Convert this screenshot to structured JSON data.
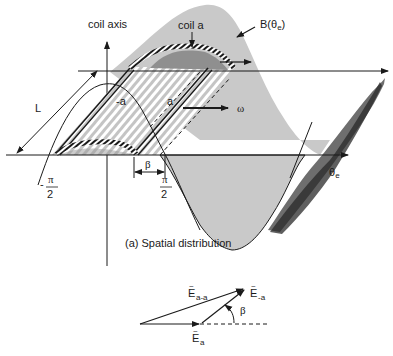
{
  "figure": {
    "top": {
      "coil_axis_label": "coil axis",
      "coil_a_label": "coil a",
      "flux_density_label": "B(θ",
      "flux_density_sub": "e",
      "flux_density_close": ")",
      "length_label": "L",
      "side_neg_a_label": "-a",
      "side_a_label": "a",
      "omega_label": "ω",
      "beta_label": "β",
      "neg_pi_minus": "-",
      "pi_label": "π",
      "two_label": "2",
      "theta_label": "θ",
      "theta_sub": "e",
      "caption": "(a) Spatial  distribution"
    },
    "phasor": {
      "e_a_minus_a_label": "E",
      "e_a_minus_a_sub": "a-a",
      "e_minus_a_label": "E",
      "e_minus_a_sub": "-a",
      "e_a_label": "E",
      "e_a_sub": "a",
      "tilde": "~",
      "beta_label": "β"
    },
    "colors": {
      "wave_fill": "#c8c8c8",
      "wave_dark": "#8a8a8a",
      "wave_shadow": "#555555",
      "hatch": "#bdbdbd",
      "line": "#1a1a1a"
    }
  }
}
